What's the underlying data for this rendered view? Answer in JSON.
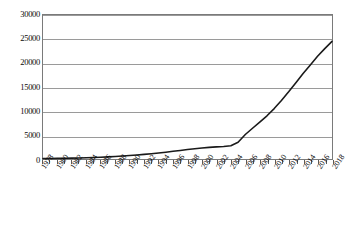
{
  "chart_data": {
    "type": "line",
    "title": "",
    "subtitle": "",
    "xlabel": "",
    "ylabel": "",
    "grid": true,
    "legend": false,
    "legend_position": "none",
    "line_color": "#1a1a1a",
    "grid_color": "#9a9a9a",
    "frame_color": "#7a7a7a",
    "xlim": [
      1978,
      2018
    ],
    "ylim": [
      0,
      30000
    ],
    "yticks": [
      0,
      5000,
      10000,
      15000,
      20000,
      25000,
      30000
    ],
    "ytick_labels": [
      "0",
      "5000",
      "10000",
      "15000",
      "20000",
      "25000",
      "30000"
    ],
    "xticks": [
      1978,
      1980,
      1982,
      1984,
      1986,
      1988,
      1990,
      1992,
      1994,
      1996,
      1998,
      2000,
      2002,
      2004,
      2006,
      2008,
      2010,
      2012,
      2014,
      2016,
      2018
    ],
    "xtick_labels": [
      "1978",
      "1980",
      "1982",
      "1984",
      "1986",
      "1988",
      "1990",
      "1992",
      "1994",
      "1996",
      "1998",
      "2000",
      "2002",
      "2004",
      "2006",
      "2008",
      "2010",
      "2012",
      "2014",
      "2016",
      "2018"
    ],
    "x": [
      1978,
      1979,
      1980,
      1981,
      1982,
      1983,
      1984,
      1985,
      1986,
      1987,
      1988,
      1989,
      1990,
      1991,
      1992,
      1993,
      1994,
      1995,
      1996,
      1997,
      1998,
      1999,
      2000,
      2001,
      2002,
      2003,
      2004,
      2005,
      2006,
      2007,
      2008,
      2009,
      2010,
      2011,
      2012,
      2013,
      2014,
      2015,
      2016,
      2017,
      2018
    ],
    "values": [
      90,
      105,
      125,
      150,
      180,
      215,
      255,
      310,
      380,
      450,
      530,
      620,
      720,
      830,
      960,
      1100,
      1250,
      1420,
      1600,
      1790,
      1980,
      2150,
      2300,
      2420,
      2520,
      2620,
      2760,
      3500,
      5100,
      6400,
      7700,
      9000,
      10500,
      12200,
      14000,
      15900,
      17800,
      19600,
      21400,
      23000,
      24500
    ],
    "series": [
      {
        "name": "series-1",
        "values": [
          90,
          105,
          125,
          150,
          180,
          215,
          255,
          310,
          380,
          450,
          530,
          620,
          720,
          830,
          960,
          1100,
          1250,
          1420,
          1600,
          1790,
          1980,
          2150,
          2300,
          2420,
          2520,
          2620,
          2760,
          3500,
          5100,
          6400,
          7700,
          9000,
          10500,
          12200,
          14000,
          15900,
          17800,
          19600,
          21400,
          23000,
          24500
        ]
      }
    ]
  }
}
